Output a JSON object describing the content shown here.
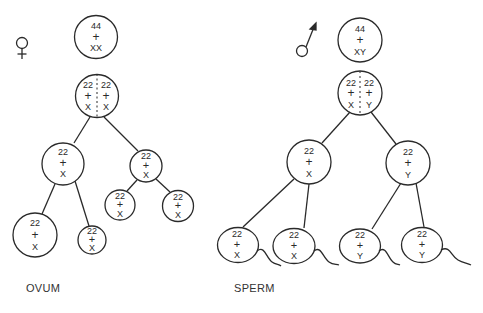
{
  "stroke_color": "#2a2a2a",
  "female": {
    "symbol": "female-symbol",
    "label": "OVUM",
    "parent": {
      "top": "44",
      "mid": "+",
      "bot": "XX"
    },
    "dividing": {
      "left": [
        "22",
        "+",
        "X"
      ],
      "right": [
        "22",
        "+",
        "X"
      ]
    },
    "secondary": [
      {
        "top": "22",
        "mid": "+",
        "bot": "X"
      },
      {
        "top": "22",
        "mid": "+",
        "bot": "X"
      }
    ],
    "products": [
      {
        "top": "22",
        "mid": "+",
        "bot": "X"
      },
      {
        "top": "22",
        "mid": "+",
        "bot": "X"
      },
      {
        "top": "22",
        "mid": "+",
        "bot": "X"
      },
      {
        "top": "22",
        "mid": "+",
        "bot": "X"
      }
    ]
  },
  "male": {
    "symbol": "male-symbol",
    "label": "SPERM",
    "parent": {
      "top": "44",
      "mid": "+",
      "bot": "XY"
    },
    "dividing": {
      "left": [
        "22",
        "+",
        "X"
      ],
      "right": [
        "22",
        "+",
        "Y"
      ]
    },
    "secondary": [
      {
        "top": "22",
        "mid": "+",
        "bot": "X"
      },
      {
        "top": "22",
        "mid": "+",
        "bot": "Y"
      }
    ],
    "products": [
      {
        "top": "22",
        "mid": "+",
        "bot": "X"
      },
      {
        "top": "22",
        "mid": "+",
        "bot": "X"
      },
      {
        "top": "22",
        "mid": "+",
        "bot": "Y"
      },
      {
        "top": "22",
        "mid": "+",
        "bot": "Y"
      }
    ]
  }
}
